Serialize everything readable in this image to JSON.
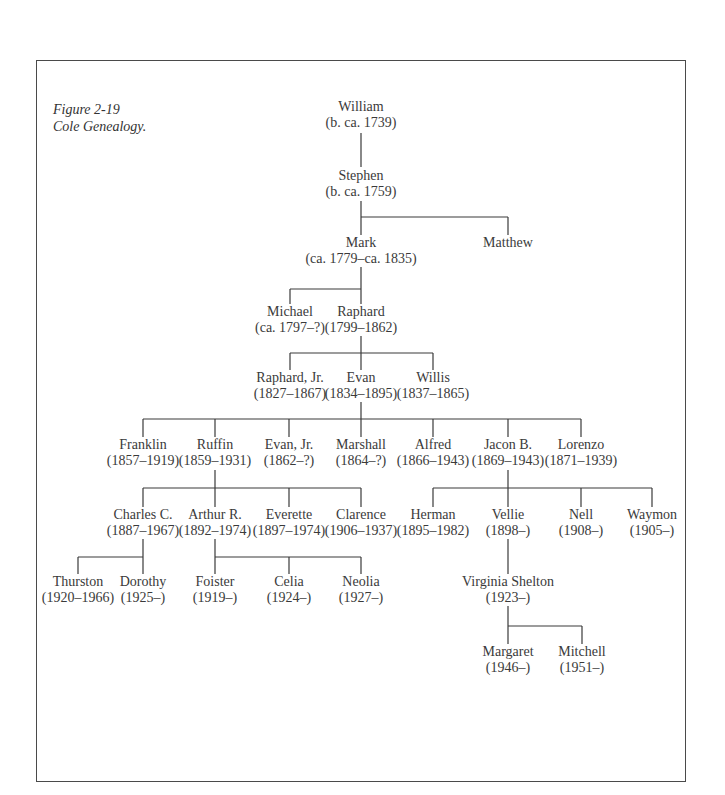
{
  "figure": {
    "number": "Figure 2-19",
    "title": "Cole Genealogy."
  },
  "people": {
    "william": {
      "name": "William",
      "dates": "(b. ca. 1739)"
    },
    "stephen": {
      "name": "Stephen",
      "dates": "(b. ca. 1759)"
    },
    "mark": {
      "name": "Mark",
      "dates": "(ca. 1779–ca. 1835)"
    },
    "matthew": {
      "name": "Matthew",
      "dates": ""
    },
    "michael": {
      "name": "Michael",
      "dates": "(ca. 1797–?)"
    },
    "raphard": {
      "name": "Raphard",
      "dates": "(1799–1862)"
    },
    "raphard_jr": {
      "name": "Raphard, Jr.",
      "dates": "(1827–1867)"
    },
    "evan": {
      "name": "Evan",
      "dates": "(1834–1895)"
    },
    "willis": {
      "name": "Willis",
      "dates": "(1837–1865)"
    },
    "franklin": {
      "name": "Franklin",
      "dates": "(1857–1919)"
    },
    "ruffin": {
      "name": "Ruffin",
      "dates": "(1859–1931)"
    },
    "evan_jr": {
      "name": "Evan, Jr.",
      "dates": "(1862–?)"
    },
    "marshall": {
      "name": "Marshall",
      "dates": "(1864–?)"
    },
    "alfred": {
      "name": "Alfred",
      "dates": "(1866–1943)"
    },
    "jacon_b": {
      "name": "Jacon B.",
      "dates": "(1869–1943)"
    },
    "lorenzo": {
      "name": "Lorenzo",
      "dates": "(1871–1939)"
    },
    "charles_c": {
      "name": "Charles C.",
      "dates": "(1887–1967)"
    },
    "arthur_r": {
      "name": "Arthur R.",
      "dates": "(1892–1974)"
    },
    "everette": {
      "name": "Everette",
      "dates": "(1897–1974)"
    },
    "clarence": {
      "name": "Clarence",
      "dates": "(1906–1937)"
    },
    "herman": {
      "name": "Herman",
      "dates": "(1895–1982)"
    },
    "vellie": {
      "name": "Vellie",
      "dates": "(1898–)"
    },
    "nell": {
      "name": "Nell",
      "dates": "(1908–)"
    },
    "waymon": {
      "name": "Waymon",
      "dates": "(1905–)"
    },
    "thurston": {
      "name": "Thurston",
      "dates": "(1920–1966)"
    },
    "dorothy": {
      "name": "Dorothy",
      "dates": "(1925–)"
    },
    "foister": {
      "name": "Foister",
      "dates": "(1919–)"
    },
    "celia": {
      "name": "Celia",
      "dates": "(1924–)"
    },
    "neolia": {
      "name": "Neolia",
      "dates": "(1927–)"
    },
    "virginia_shelton": {
      "name": "Virginia Shelton",
      "dates": "(1923–)"
    },
    "margaret": {
      "name": "Margaret",
      "dates": "(1946–)"
    },
    "mitchell": {
      "name": "Mitchell",
      "dates": "(1951–)"
    }
  }
}
